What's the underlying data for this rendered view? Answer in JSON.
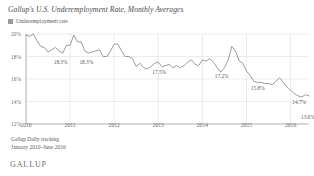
{
  "title": "Gallup's U.S. Underemployment Rate, Monthly Averages",
  "legend": {
    "label": "Underemployment rate",
    "swatch_color": "#9a9a9d"
  },
  "footer": {
    "line1": "Gallup Daily tracking",
    "line2": "January 2010–June 2016"
  },
  "brand": "GALLUP",
  "chart_data": {
    "type": "line",
    "title": "Gallup's U.S. Underemployment Rate, Monthly Averages",
    "subtitle": "Gallup Daily tracking, January 2010–June 2016",
    "xlabel": "",
    "ylabel": "",
    "ylim": [
      12,
      20
    ],
    "y_ticks": [
      "12%",
      "14%",
      "16%",
      "18%",
      "20%"
    ],
    "y_tick_values": [
      12,
      14,
      16,
      18,
      20
    ],
    "x_ticks": [
      "2010",
      "2011",
      "2012",
      "2013",
      "2014",
      "2015",
      "2016"
    ],
    "x_tick_values": [
      2010,
      2011,
      2012,
      2013,
      2014,
      2015,
      2016
    ],
    "grid": true,
    "legend_position": "top-left",
    "line_color": "#8a8a8d",
    "series": [
      {
        "name": "Underemployment rate",
        "x": [
          "2010-01",
          "2010-02",
          "2010-03",
          "2010-04",
          "2010-05",
          "2010-06",
          "2010-07",
          "2010-08",
          "2010-09",
          "2010-10",
          "2010-11",
          "2010-12",
          "2011-01",
          "2011-02",
          "2011-03",
          "2011-04",
          "2011-05",
          "2011-06",
          "2011-07",
          "2011-08",
          "2011-09",
          "2011-10",
          "2011-11",
          "2011-12",
          "2012-01",
          "2012-02",
          "2012-03",
          "2012-04",
          "2012-05",
          "2012-06",
          "2012-07",
          "2012-08",
          "2012-09",
          "2012-10",
          "2012-11",
          "2012-12",
          "2013-01",
          "2013-02",
          "2013-03",
          "2013-04",
          "2013-05",
          "2013-06",
          "2013-07",
          "2013-08",
          "2013-09",
          "2013-10",
          "2013-11",
          "2013-12",
          "2014-01",
          "2014-02",
          "2014-03",
          "2014-04",
          "2014-05",
          "2014-06",
          "2014-07",
          "2014-08",
          "2014-09",
          "2014-10",
          "2014-11",
          "2014-12",
          "2015-01",
          "2015-02",
          "2015-03",
          "2015-04",
          "2015-05",
          "2015-06",
          "2015-07",
          "2015-08",
          "2015-09",
          "2015-10",
          "2015-11",
          "2015-12",
          "2016-01",
          "2016-02",
          "2016-03",
          "2016-04",
          "2016-05",
          "2016-06"
        ],
        "values": [
          19.9,
          19.8,
          20.0,
          19.4,
          18.9,
          18.8,
          18.4,
          18.6,
          18.8,
          18.5,
          18.3,
          19.0,
          19.0,
          19.9,
          19.3,
          19.3,
          18.5,
          18.3,
          18.4,
          18.5,
          18.6,
          18.0,
          18.0,
          18.5,
          19.1,
          19.1,
          18.5,
          18.0,
          18.0,
          17.8,
          17.1,
          17.4,
          17.0,
          16.9,
          17.1,
          17.4,
          17.5,
          17.1,
          17.2,
          17.3,
          17.0,
          17.2,
          17.0,
          17.2,
          17.5,
          17.7,
          17.3,
          17.2,
          17.7,
          17.6,
          17.8,
          17.5,
          17.0,
          16.6,
          17.0,
          17.7,
          18.9,
          18.5,
          17.6,
          17.4,
          16.7,
          16.3,
          15.8,
          15.7,
          15.7,
          15.6,
          15.6,
          15.5,
          15.8,
          16.1,
          15.7,
          15.3,
          15.0,
          14.7,
          14.5,
          14.4,
          14.6,
          14.5
        ]
      }
    ],
    "annotations": [
      {
        "label": "18.3%",
        "x": "2010-11",
        "value": 18.3
      },
      {
        "label": "18.3%",
        "x": "2011-06",
        "value": 18.3
      },
      {
        "label": "17.5%",
        "x": "2013-01",
        "value": 17.5
      },
      {
        "label": "17.2%",
        "x": "2014-06",
        "value": 17.2
      },
      {
        "label": "15.8%",
        "x": "2015-03",
        "value": 15.8
      },
      {
        "label": "14.7%",
        "x": "2016-02",
        "value": 14.7
      },
      {
        "label": "13.6%",
        "x": "2016-06",
        "value": 13.6
      }
    ]
  }
}
